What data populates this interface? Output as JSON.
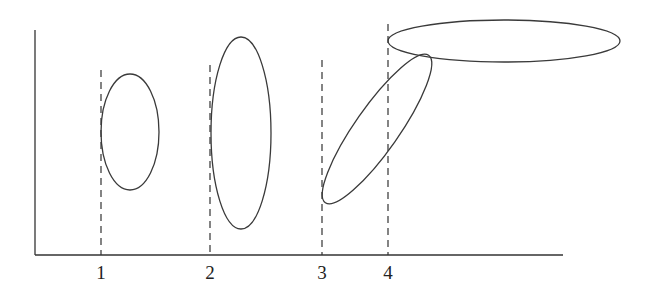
{
  "diagram": {
    "axes": {
      "origin": [
        35,
        255
      ],
      "y_top": 30,
      "x_end": 563,
      "color": "#333333"
    },
    "ticks": [
      {
        "label": "1",
        "x": 101,
        "dash_top": 70
      },
      {
        "label": "2",
        "x": 210,
        "dash_top": 65
      },
      {
        "label": "3",
        "x": 322,
        "dash_top": 60
      },
      {
        "label": "4",
        "x": 388,
        "dash_top": 24
      }
    ],
    "ellipses": [
      {
        "id": "ellipse-1",
        "cx": 130,
        "cy": 132,
        "rx": 29,
        "ry": 58,
        "rotate": 0
      },
      {
        "id": "ellipse-2",
        "cx": 241,
        "cy": 133,
        "rx": 30,
        "ry": 96,
        "rotate": 0
      },
      {
        "id": "ellipse-3",
        "cx": 377,
        "cy": 129,
        "rx": 90,
        "ry": 22,
        "rotate": -55
      },
      {
        "id": "ellipse-4",
        "cx": 504,
        "cy": 41,
        "rx": 116,
        "ry": 21,
        "rotate": 0
      }
    ],
    "stroke_color": "#3a3a3a"
  }
}
